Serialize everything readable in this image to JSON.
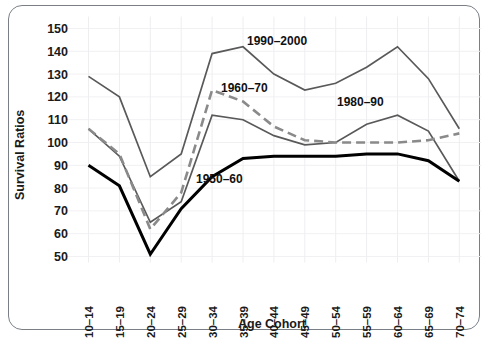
{
  "chart_data": {
    "type": "line",
    "title": "",
    "xlabel": "Age Cohort",
    "ylabel": "Survival Ratios",
    "ylim": [
      50,
      150
    ],
    "yticks": [
      50,
      60,
      70,
      80,
      90,
      100,
      110,
      120,
      130,
      140,
      150
    ],
    "grid": true,
    "legend_position": "inline-annotations",
    "categories": [
      "10–14",
      "15–19",
      "20–24",
      "25–29",
      "30–34",
      "35–39",
      "40–44",
      "45–49",
      "50–54",
      "55–59",
      "60–64",
      "65–69",
      "70–74"
    ],
    "series": [
      {
        "name": "1950–60",
        "style": "solid-thick-black",
        "color": "#000000",
        "values": [
          90,
          81,
          51,
          71,
          85,
          93,
          94,
          94,
          94,
          95,
          95,
          92,
          83
        ]
      },
      {
        "name": "1960–70",
        "style": "dashed-gray",
        "color": "#8a8a8a",
        "values": [
          106,
          95,
          62,
          78,
          123,
          118,
          107,
          101,
          100,
          100,
          100,
          101,
          104
        ]
      },
      {
        "name": "1980–90",
        "style": "solid-thin-gray",
        "color": "#595959",
        "values": [
          106,
          94,
          65,
          74,
          112,
          110,
          103,
          99,
          100,
          108,
          112,
          105,
          83
        ]
      },
      {
        "name": "1990–2000",
        "style": "solid-thin-gray",
        "color": "#595959",
        "values": [
          129,
          120,
          85,
          95,
          139,
          142,
          130,
          123,
          126,
          133,
          142,
          128,
          106
        ]
      }
    ],
    "annotations": [
      {
        "text": "1990–2000",
        "x_px": 247,
        "y_px": 45
      },
      {
        "text": "1960–70",
        "x_px": 221,
        "y_px": 92
      },
      {
        "text": "1980–90",
        "x_px": 337,
        "y_px": 106
      },
      {
        "text": "1950–60",
        "x_px": 196,
        "y_px": 183
      }
    ]
  },
  "axis": {
    "ylabel": "Survival Ratios",
    "xlabel": "Age Cohort"
  }
}
